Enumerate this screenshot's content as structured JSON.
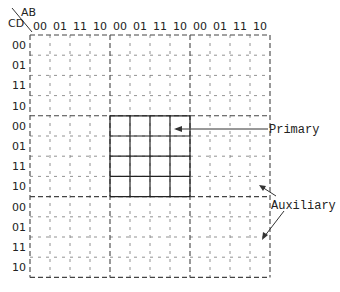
{
  "diagram": {
    "corner": {
      "row_var": "CD",
      "col_var": "AB"
    },
    "column_labels": [
      "00",
      "01",
      "11",
      "10",
      "00",
      "01",
      "11",
      "10",
      "00",
      "01",
      "11",
      "10"
    ],
    "row_labels": [
      "00",
      "01",
      "11",
      "10",
      "00",
      "01",
      "11",
      "10",
      "00",
      "01",
      "11",
      "10"
    ],
    "annotations": {
      "primary": "Primary",
      "auxiliary": "Auxiliary"
    },
    "colors": {
      "line": "#333333",
      "dashed": "#555555",
      "text": "#222222"
    }
  }
}
